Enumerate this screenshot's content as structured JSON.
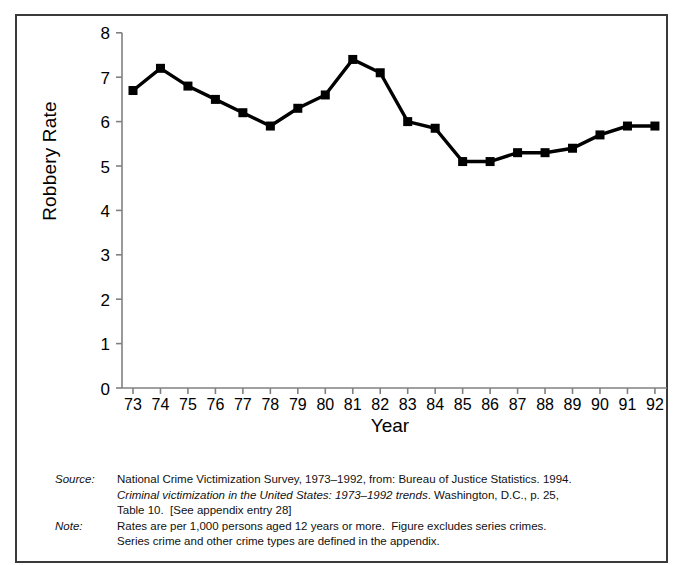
{
  "chart_data": {
    "type": "line",
    "title": "",
    "xlabel": "Year",
    "ylabel": "Robbery Rate",
    "categories": [
      "73",
      "74",
      "75",
      "76",
      "77",
      "78",
      "79",
      "80",
      "81",
      "82",
      "83",
      "84",
      "85",
      "86",
      "87",
      "88",
      "89",
      "90",
      "91",
      "92"
    ],
    "x": [
      1973,
      1974,
      1975,
      1976,
      1977,
      1978,
      1979,
      1980,
      1981,
      1982,
      1983,
      1984,
      1985,
      1986,
      1987,
      1988,
      1989,
      1990,
      1991,
      1992
    ],
    "values": [
      6.7,
      7.2,
      6.8,
      6.5,
      6.2,
      5.9,
      6.3,
      6.6,
      7.4,
      7.1,
      6.0,
      5.85,
      5.1,
      5.1,
      5.3,
      5.3,
      5.4,
      5.7,
      5.9,
      5.9
    ],
    "series": [
      {
        "name": "Robbery Rate",
        "values": [
          6.7,
          7.2,
          6.8,
          6.5,
          6.2,
          5.9,
          6.3,
          6.6,
          7.4,
          7.1,
          6.0,
          5.85,
          5.1,
          5.1,
          5.3,
          5.3,
          5.4,
          5.7,
          5.9,
          5.9
        ]
      }
    ],
    "ylim": [
      0,
      8
    ],
    "yticks": [
      "0",
      "1",
      "2",
      "3",
      "4",
      "5",
      "6",
      "7",
      "8"
    ],
    "ytick_values": [
      0,
      1,
      2,
      3,
      4,
      5,
      6,
      7,
      8
    ],
    "grid": false,
    "legend": "none",
    "marker": "square",
    "line_color": "#000000",
    "marker_color": "#000000",
    "axis_color": "#808080"
  },
  "axes": {
    "y_title": "Robbery Rate",
    "x_title": "Year"
  },
  "footnotes": {
    "source_label": "Source:",
    "source_line1": "National Crime Victimization Survey, 1973–1992, from: Bureau of Justice Statistics. 1994.",
    "source_line2_italic": "Criminal victimization in the United States: 1973–1992 trends",
    "source_line2_rest": ". Washington, D.C., p. 25,",
    "source_line3": "Table 10.  [See appendix entry 28]",
    "note_label": "Note:",
    "note_line1": "Rates are per 1,000 persons aged 12 years or more.  Figure excludes series crimes.",
    "note_line2": "Series crime and other crime types are defined in the appendix."
  }
}
